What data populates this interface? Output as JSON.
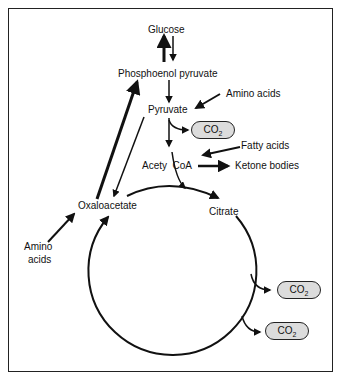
{
  "diagram": {
    "nodes": {
      "glucose": "Glucose",
      "pep": "Phosphoenol pyruvate",
      "pyruvate": "Pyruvate",
      "amino_acids_top": "Amino acids",
      "co2_1": "CO",
      "co2_sub": "2",
      "fatty_acids": "Fatty acids",
      "acetyl_coa": "Acety  CoA",
      "ketone_bodies": "Ketone bodies",
      "oxaloacetate": "Oxaloacetate",
      "citrate": "Citrate",
      "amino_acids_left_1": "Amino",
      "amino_acids_left_2": "acids"
    },
    "colors": {
      "line": "#111111",
      "pill_fill": "#dcdcdc",
      "background": "#ffffff"
    }
  }
}
